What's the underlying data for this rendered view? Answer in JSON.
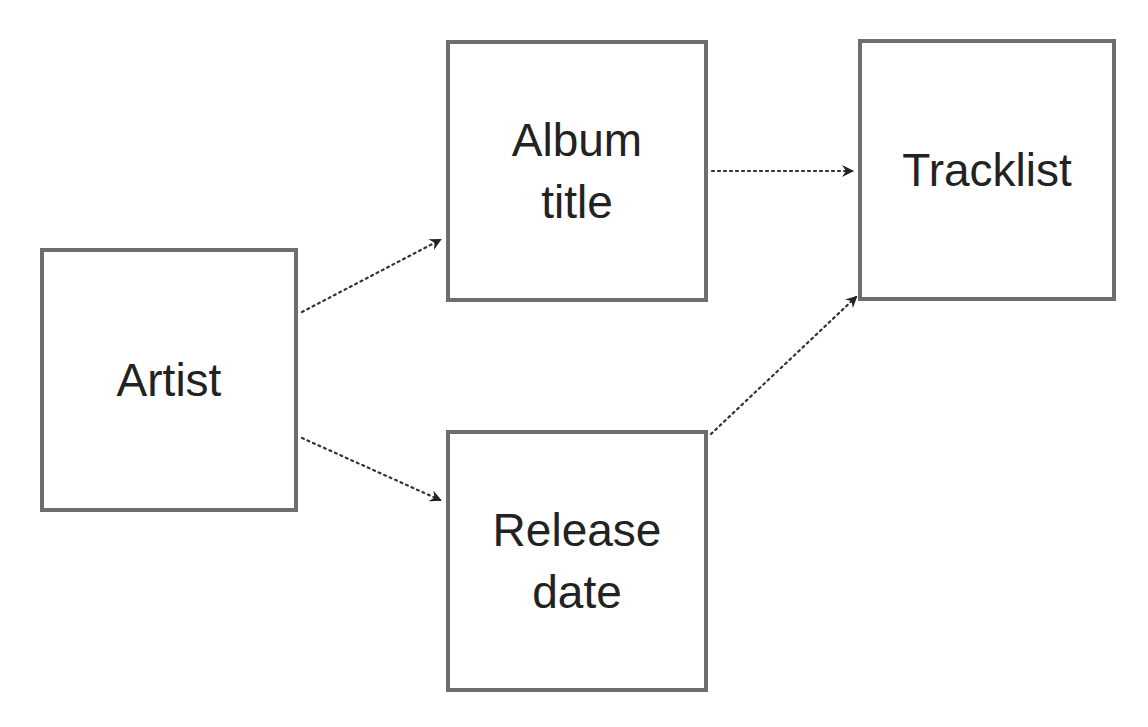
{
  "diagram": {
    "type": "flow",
    "colors": {
      "border": "#6e6e6e",
      "text": "#222222",
      "arrow": "#222222",
      "background": "#ffffff"
    },
    "nodes": [
      {
        "id": "artist",
        "label": "Artist",
        "x": 40,
        "y": 248,
        "w": 258,
        "h": 264
      },
      {
        "id": "album_title",
        "label": "Album\ntitle",
        "x": 446,
        "y": 40,
        "w": 262,
        "h": 262
      },
      {
        "id": "release_date",
        "label": "Release\ndate",
        "x": 446,
        "y": 430,
        "w": 262,
        "h": 262
      },
      {
        "id": "tracklist",
        "label": "Tracklist",
        "x": 858,
        "y": 39,
        "w": 258,
        "h": 262
      }
    ],
    "edges": [
      {
        "from": "artist",
        "to": "album_title",
        "style": "dotted",
        "arrow": "end"
      },
      {
        "from": "artist",
        "to": "release_date",
        "style": "dotted",
        "arrow": "end"
      },
      {
        "from": "album_title",
        "to": "tracklist",
        "style": "dotted",
        "arrow": "end"
      },
      {
        "from": "release_date",
        "to": "tracklist",
        "style": "dotted",
        "arrow": "end"
      }
    ]
  }
}
